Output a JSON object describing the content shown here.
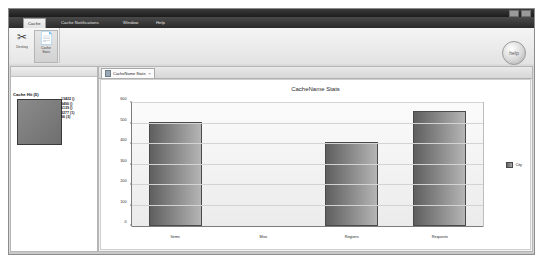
{
  "window": {
    "controls": [
      "minimize",
      "maximize",
      "close"
    ]
  },
  "ribbon": {
    "tabs": [
      {
        "label": "Cache",
        "active": true
      },
      {
        "label": "Cache Notifications",
        "active": false
      },
      {
        "label": "Window",
        "active": false
      },
      {
        "label": "Help",
        "active": false
      }
    ],
    "buttons": [
      {
        "label": "Destroy",
        "icon": "scissors-icon",
        "selected": false
      },
      {
        "label": "Cache\nStats",
        "icon": "document-icon",
        "selected": true
      }
    ],
    "help_button_label": "help"
  },
  "left_view": {
    "title": "Cache Hit (5)",
    "legend": [
      "13422 ()",
      "",
      "9490 ()",
      "6139 ()",
      "3277 (1)",
      "96 (3)"
    ]
  },
  "editor": {
    "tab": {
      "label": "CacheName Stats",
      "icon": "chart-icon",
      "close": "×"
    }
  },
  "chart_data": {
    "type": "bar",
    "title": "CacheName Stats",
    "categories": [
      "Items",
      "Miss",
      "Regions",
      "Requests"
    ],
    "values": [
      500,
      0,
      400,
      550
    ],
    "series": [
      {
        "name": "City",
        "values": [
          500,
          0,
          400,
          550
        ]
      }
    ],
    "xlabel": "",
    "ylabel": "",
    "ylim": [
      0,
      600
    ],
    "yticks": [
      0,
      100,
      200,
      300,
      400,
      500,
      600
    ],
    "grid": true,
    "legend_position": "right",
    "legend_entries": [
      "City"
    ]
  }
}
